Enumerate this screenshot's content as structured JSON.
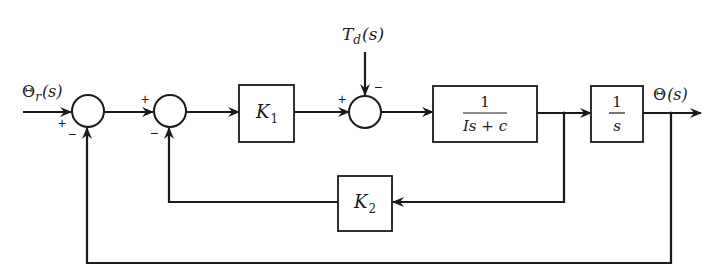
{
  "diagram": {
    "type": "control-system-block-diagram",
    "signals": {
      "input": {
        "symbol": "Θ",
        "subscript": "r",
        "arg": "(s)"
      },
      "disturbance": {
        "symbol": "T",
        "subscript": "d",
        "arg": "(s)"
      },
      "output": {
        "symbol": "Θ",
        "arg": "(s)"
      }
    },
    "blocks": {
      "k1": {
        "symbol": "K",
        "subscript": "1"
      },
      "plant": {
        "numerator": "1",
        "denominator": "Is + c"
      },
      "integrator": {
        "numerator": "1",
        "denominator": "s"
      },
      "k2": {
        "symbol": "K",
        "subscript": "2"
      }
    },
    "summing_junctions": {
      "sum1": {
        "in_plus": "+",
        "in_minus": "−"
      },
      "sum2": {
        "in_plus": "+",
        "in_minus": "−"
      },
      "sum3": {
        "in_plus": "+",
        "in_minus": "−"
      }
    },
    "colors": {
      "ink": "#1a1a1a",
      "background": "#ffffff"
    }
  }
}
